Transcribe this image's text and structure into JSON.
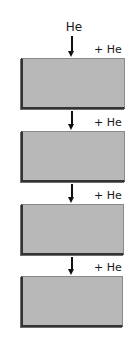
{
  "diagram": {
    "type": "sequential-flow",
    "input_label": "He",
    "stages": [
      {
        "index": 1,
        "add_label": "+ He"
      },
      {
        "index": 2,
        "add_label": "+ He"
      },
      {
        "index": 3,
        "add_label": "+ He"
      },
      {
        "index": 4,
        "add_label": "+ He"
      }
    ],
    "colors": {
      "box_fill": "#b8b8b8",
      "box_edge": "#333333",
      "arrow": "#111111",
      "background": "#ffffff"
    }
  }
}
